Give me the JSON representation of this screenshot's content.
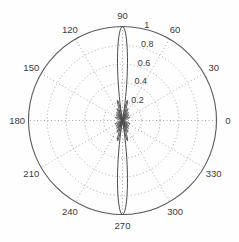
{
  "figure": {
    "background": "#fefefe"
  },
  "chart_data": {
    "type": "line",
    "subtype": "polar",
    "title": "",
    "xlabel": "",
    "ylabel": "",
    "rlim": [
      0,
      1
    ],
    "grid": "dotted",
    "legend": "none",
    "angle_ticks": [
      {
        "deg": 0,
        "label": "0"
      },
      {
        "deg": 30,
        "label": "30"
      },
      {
        "deg": 60,
        "label": "60"
      },
      {
        "deg": 90,
        "label": "90"
      },
      {
        "deg": 120,
        "label": "120"
      },
      {
        "deg": 150,
        "label": "150"
      },
      {
        "deg": 180,
        "label": "180"
      },
      {
        "deg": 210,
        "label": "210"
      },
      {
        "deg": 240,
        "label": "240"
      },
      {
        "deg": 270,
        "label": "270"
      },
      {
        "deg": 300,
        "label": "300"
      },
      {
        "deg": 330,
        "label": "330"
      }
    ],
    "radial_ticks": [
      {
        "r": 0.2,
        "label": "0.2"
      },
      {
        "r": 0.4,
        "label": "0.4"
      },
      {
        "r": 0.6,
        "label": "0.6"
      },
      {
        "r": 0.8,
        "label": "0.8"
      },
      {
        "r": 1.0,
        "label": "1"
      }
    ],
    "radial_label_angle_deg": 80,
    "series": [
      {
        "name": "uniform-linear-array-factor",
        "model": "abs(sin(N*pi*d*cos(theta)) / (N*sin(pi*d*cos(theta))))",
        "elements": 12,
        "spacing_wavelengths": 0.5,
        "sample_step_deg": 0.5,
        "angle_range_deg": [
          0,
          360
        ],
        "main_lobes": [
          {
            "angle_deg": 90,
            "r": 1.0
          },
          {
            "angle_deg": 270,
            "r": 1.0
          }
        ],
        "first_sidelobe_r": 0.22,
        "nulls_deg_offset_from_main": 9.6
      }
    ],
    "colors": {
      "curve": "#4d4d4d",
      "outer_circle": "#595959",
      "grid_dots": "#999999",
      "labels": "#3a3a3a",
      "background": "#fefefe"
    }
  }
}
